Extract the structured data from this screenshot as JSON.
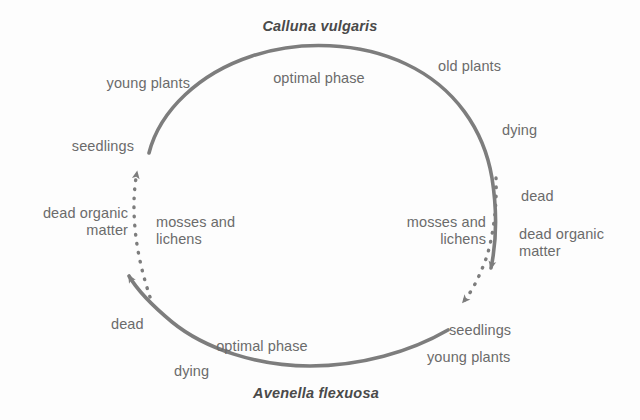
{
  "figure": {
    "kind": "cyclical-succession-diagram",
    "background_color": "#fdfdfd",
    "stroke_color": "#7d7d7d",
    "label_color": "#6b6b6b",
    "species_color": "#4a4a4a"
  },
  "species": {
    "top": "Calluna vulgaris",
    "bottom": "Avenella flexuosa"
  },
  "calluna_cycle": {
    "phase_label": "optimal phase",
    "stages": [
      "young plants",
      "old plants",
      "dying",
      "dead",
      "dead organic matter",
      "seedlings"
    ],
    "young_plants": "young plants",
    "old_plants": "old plants",
    "dying": "dying",
    "dead": "dead",
    "dead_organic_matter": "dead organic\nmatter",
    "seedlings": "seedlings",
    "colonisers": "mosses and\nlichens"
  },
  "avenella_cycle": {
    "phase_label": "optimal phase",
    "stages": [
      "seedlings",
      "young plants",
      "dying",
      "dead",
      "dead organic matter",
      "seedlings"
    ],
    "seedlings": "seedlings",
    "young_plants": "young plants",
    "dying": "dying",
    "dead": "dead",
    "dead_organic_matter": "dead organic\nmatter",
    "colonisers": "mosses and\nlichens"
  }
}
